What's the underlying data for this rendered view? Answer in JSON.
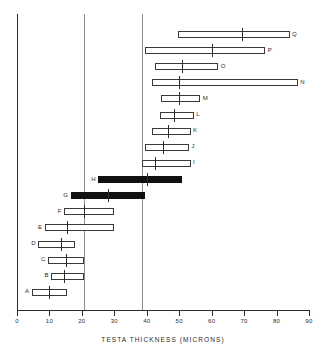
{
  "chart_data": {
    "type": "bar",
    "orientation": "horizontal",
    "title": "",
    "subtitle": "",
    "xlabel": "TESTA  THICKNESS  (MICRONS)",
    "ylabel": "",
    "xlim": [
      0,
      90
    ],
    "ylim": null,
    "xticks": [
      0,
      10,
      20,
      30,
      40,
      50,
      60,
      70,
      80,
      90
    ],
    "xticklabels": [
      "0",
      "10",
      "20",
      "30",
      "40",
      "50",
      "60",
      "70",
      "80",
      "90"
    ],
    "grid": true,
    "gridlines_x": [
      20.5,
      38.5
    ],
    "legend": null,
    "legend_position": "none",
    "series": [
      {
        "name": "range",
        "bars": [
          {
            "label": "Q",
            "min": 49.5,
            "max": 84.0,
            "mean": 69.5,
            "fill": "open",
            "label_side": "right"
          },
          {
            "label": "P",
            "min": 39.5,
            "max": 76.5,
            "mean": 60.0,
            "fill": "open",
            "label_side": "right"
          },
          {
            "label": "O",
            "min": 42.5,
            "max": 62.0,
            "mean": 51.0,
            "fill": "open",
            "label_side": "right"
          },
          {
            "label": "N",
            "min": 41.5,
            "max": 86.5,
            "mean": 50.0,
            "fill": "open",
            "label_side": "right"
          },
          {
            "label": "M",
            "min": 44.5,
            "max": 56.5,
            "mean": 50.0,
            "fill": "open",
            "label_side": "right"
          },
          {
            "label": "L",
            "min": 44.0,
            "max": 54.5,
            "mean": 48.5,
            "fill": "open",
            "label_side": "right"
          },
          {
            "label": "K",
            "min": 41.5,
            "max": 53.5,
            "mean": 46.5,
            "fill": "open",
            "label_side": "right"
          },
          {
            "label": "J",
            "min": 39.5,
            "max": 53.0,
            "mean": 45.0,
            "fill": "open",
            "label_side": "right"
          },
          {
            "label": "I",
            "min": 38.5,
            "max": 53.5,
            "mean": 42.5,
            "fill": "open",
            "label_side": "right"
          },
          {
            "label": "H",
            "min": 25.0,
            "max": 51.0,
            "mean": 40.0,
            "fill": "solid",
            "label_side": "left"
          },
          {
            "label": "G",
            "min": 16.5,
            "max": 39.5,
            "mean": 28.0,
            "fill": "solid",
            "label_side": "left"
          },
          {
            "label": "F",
            "min": 14.5,
            "max": 30.0,
            "mean": 20.5,
            "fill": "open",
            "label_side": "left"
          },
          {
            "label": "E",
            "min": 8.5,
            "max": 30.0,
            "mean": 15.5,
            "fill": "open",
            "label_side": "left"
          },
          {
            "label": "D",
            "min": 6.5,
            "max": 18.0,
            "mean": 13.5,
            "fill": "open",
            "label_side": "left"
          },
          {
            "label": "C",
            "min": 9.5,
            "max": 20.5,
            "mean": 15.0,
            "fill": "open",
            "label_side": "left"
          },
          {
            "label": "B",
            "min": 10.5,
            "max": 20.5,
            "mean": 14.5,
            "fill": "open",
            "label_side": "left"
          },
          {
            "label": "A",
            "min": 4.5,
            "max": 15.5,
            "mean": 10.0,
            "fill": "open",
            "label_side": "left"
          }
        ]
      }
    ]
  },
  "colors": {
    "axis": "#2b2b2b",
    "grid": "#8e8e8e",
    "bar_open_fill": "#ffffff",
    "bar_outline": "#3a3a3a",
    "bar_solid_fill": "#111111",
    "text": "#2b2b2b",
    "background": "#ffffff"
  }
}
